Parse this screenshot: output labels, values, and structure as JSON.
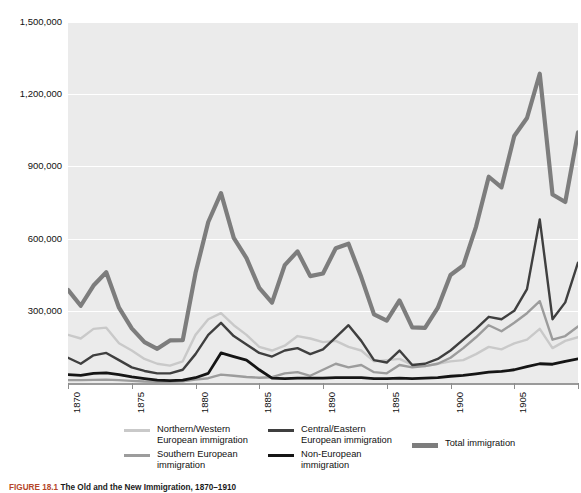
{
  "figure": {
    "caption_number": "FIGURE 18.1",
    "caption_title": "The Old and the New Immigration, 1870–1910"
  },
  "axes": {
    "y_ticks": [
      "1,500,000",
      "1,200,000",
      "900,000",
      "600,000",
      "300,000"
    ],
    "x_ticks": [
      "1870",
      "1875",
      "1880",
      "1885",
      "1890",
      "1895",
      "1900",
      "1905",
      "1910"
    ]
  },
  "legend": {
    "items": [
      {
        "label": "Northern/Western\nEuropean immigration",
        "color": "#c9c9c9",
        "thickness": 2.5
      },
      {
        "label": "Southern European\nimmigration",
        "color": "#9c9c9c",
        "thickness": 2.5
      },
      {
        "label": "Central/Eastern\nEuropean immigration",
        "color": "#3f3f3f",
        "thickness": 2.5
      },
      {
        "label": "Non-European\nimmigration",
        "color": "#151515",
        "thickness": 3
      },
      {
        "label": "Total immigration",
        "color": "#7d7d7d",
        "thickness": 4.5
      }
    ]
  },
  "chart_data": {
    "type": "line",
    "title": "The Old and the New Immigration, 1870–1910",
    "xlabel": "",
    "ylabel": "",
    "xlim": [
      1870,
      1910
    ],
    "ylim": [
      0,
      1500000
    ],
    "ytick_values": [
      300000,
      600000,
      900000,
      1200000,
      1500000
    ],
    "xtick_values": [
      1870,
      1875,
      1880,
      1885,
      1890,
      1895,
      1900,
      1905,
      1910
    ],
    "grid": true,
    "legend_position": "below",
    "x": [
      1870,
      1871,
      1872,
      1873,
      1874,
      1875,
      1876,
      1877,
      1878,
      1879,
      1880,
      1881,
      1882,
      1883,
      1884,
      1885,
      1886,
      1887,
      1888,
      1889,
      1890,
      1891,
      1892,
      1893,
      1894,
      1895,
      1896,
      1897,
      1898,
      1899,
      1900,
      1901,
      1902,
      1903,
      1904,
      1905,
      1906,
      1907,
      1908,
      1909,
      1910
    ],
    "series": [
      {
        "name": "Northern/Western European immigration",
        "color": "#c9c9c9",
        "values": [
          200000,
          185000,
          225000,
          230000,
          165000,
          135000,
          100000,
          80000,
          72000,
          90000,
          200000,
          265000,
          290000,
          240000,
          200000,
          150000,
          135000,
          155000,
          195000,
          185000,
          170000,
          175000,
          150000,
          135000,
          90000,
          95000,
          100000,
          75000,
          70000,
          80000,
          90000,
          95000,
          120000,
          150000,
          140000,
          165000,
          180000,
          225000,
          145000,
          175000,
          190000
        ]
      },
      {
        "name": "Southern European immigration",
        "color": "#9c9c9c",
        "values": [
          12000,
          12000,
          13000,
          14000,
          12000,
          9000,
          6000,
          5000,
          5000,
          7000,
          14000,
          20000,
          35000,
          30000,
          25000,
          22000,
          24000,
          40000,
          45000,
          30000,
          55000,
          80000,
          65000,
          75000,
          45000,
          40000,
          75000,
          65000,
          70000,
          80000,
          105000,
          145000,
          190000,
          240000,
          215000,
          250000,
          290000,
          340000,
          180000,
          195000,
          235000
        ]
      },
      {
        "name": "Central/Eastern European immigration",
        "color": "#3f3f3f",
        "values": [
          105000,
          80000,
          115000,
          125000,
          95000,
          65000,
          50000,
          40000,
          40000,
          55000,
          120000,
          200000,
          250000,
          195000,
          160000,
          125000,
          110000,
          135000,
          145000,
          120000,
          140000,
          190000,
          240000,
          175000,
          95000,
          85000,
          135000,
          75000,
          80000,
          100000,
          135000,
          180000,
          225000,
          275000,
          265000,
          300000,
          390000,
          680000,
          265000,
          335000,
          500000
        ]
      },
      {
        "name": "Non-European immigration",
        "color": "#151515",
        "values": [
          35000,
          32000,
          40000,
          42000,
          35000,
          25000,
          18000,
          12000,
          10000,
          12000,
          22000,
          40000,
          125000,
          110000,
          95000,
          55000,
          20000,
          18000,
          20000,
          20000,
          20000,
          22000,
          22000,
          22000,
          18000,
          18000,
          20000,
          18000,
          20000,
          22000,
          28000,
          32000,
          38000,
          45000,
          48000,
          55000,
          68000,
          80000,
          78000,
          90000,
          100000
        ]
      },
      {
        "name": "Total immigration",
        "color": "#7d7d7d",
        "values": [
          387000,
          321000,
          405000,
          460000,
          313000,
          227000,
          170000,
          142000,
          177000,
          178000,
          457000,
          669000,
          789000,
          603000,
          519000,
          395000,
          334000,
          490000,
          547000,
          444000,
          455000,
          560000,
          579000,
          440000,
          285000,
          259000,
          343000,
          231000,
          229000,
          312000,
          449000,
          488000,
          649000,
          857000,
          813000,
          1026000,
          1101000,
          1285000,
          783000,
          752000,
          1041000
        ]
      }
    ]
  }
}
